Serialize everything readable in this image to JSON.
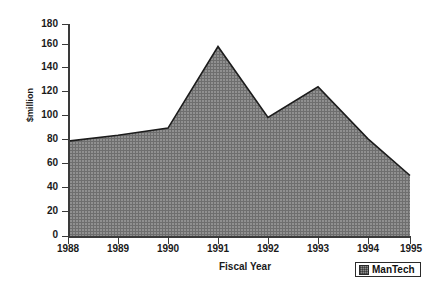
{
  "chart_data": {
    "type": "area",
    "title": "",
    "xlabel": "Fiscal Year",
    "ylabel": "$million",
    "categories": [
      "1988",
      "1989",
      "1990",
      "1991",
      "1992",
      "1993",
      "1994",
      "1995"
    ],
    "values": [
      81,
      86,
      92,
      161,
      101,
      127,
      83,
      52
    ],
    "series": [
      {
        "name": "ManTech",
        "values": [
          81,
          86,
          92,
          161,
          101,
          127,
          83,
          52
        ]
      }
    ],
    "ylim": [
      0,
      180
    ],
    "yticks": [
      0,
      20,
      40,
      60,
      80,
      100,
      120,
      140,
      160,
      180
    ],
    "ytick_labels": [
      "0",
      "20",
      "40",
      "60",
      "80",
      "100",
      "120",
      "140",
      "160",
      "180"
    ],
    "xtick_labels": [
      "1988",
      "1989",
      "1990",
      "1991",
      "1992",
      "1993",
      "1994",
      "1995"
    ],
    "grid": false,
    "legend_position": "bottom-right",
    "legend_entries": [
      "ManTech"
    ],
    "colors": {
      "area_fill": "#8d8d8d",
      "area_line": "#1c1c1c",
      "axis": "#3a3a3a",
      "text": "#1a1a1a",
      "background": "#ffffff"
    }
  },
  "legend": {
    "label": "ManTech",
    "swatch_icon": "hatched-square-swatch-icon"
  },
  "axes": {
    "x_title": "Fiscal Year",
    "y_title": "$million"
  }
}
